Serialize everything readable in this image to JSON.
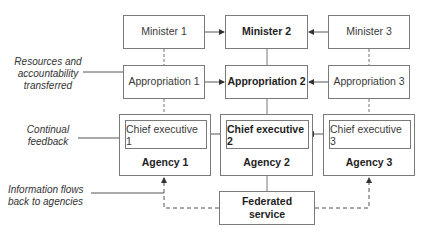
{
  "diagram": {
    "ministers": [
      {
        "label": "Minister 1",
        "emphasis": false
      },
      {
        "label": "Minister 2",
        "emphasis": true
      },
      {
        "label": "Minister 3",
        "emphasis": false
      }
    ],
    "appropriations": [
      {
        "label": "Appropriation 1",
        "emphasis": false
      },
      {
        "label": "Appropriation 2",
        "emphasis": true
      },
      {
        "label": "Appropriation 3",
        "emphasis": false
      }
    ],
    "agencies": [
      {
        "label": "Agency 1",
        "chief_executive": "Chief executive 1",
        "emphasis": false
      },
      {
        "label": "Agency 2",
        "chief_executive": "Chief executive 2",
        "emphasis": true
      },
      {
        "label": "Agency 3",
        "chief_executive": "Chief executive 3",
        "emphasis": false
      }
    ],
    "federated_service": {
      "line1": "Federated",
      "line2": "service"
    },
    "annotations": {
      "resources": {
        "line1": "Resources and",
        "line2": "accountability",
        "line3": "transferred"
      },
      "feedback": {
        "line1": "Continual",
        "line2": "feedback"
      },
      "information": {
        "line1": "Information flows",
        "line2": "back to agencies"
      }
    },
    "colors": {
      "line": "#7a7a7a",
      "text": "#333333",
      "connector": "#555555"
    }
  }
}
